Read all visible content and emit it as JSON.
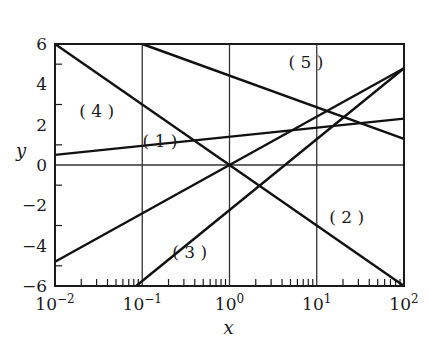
{
  "chart_data": {
    "type": "line",
    "title": "",
    "xlabel": "x",
    "ylabel": "y",
    "xscale": "log",
    "xlim": [
      0.01,
      100
    ],
    "ylim": [
      -6,
      6
    ],
    "x_ticks": [
      {
        "value": 0.01,
        "base": "10",
        "exp": "−2"
      },
      {
        "value": 0.1,
        "base": "10",
        "exp": "−1"
      },
      {
        "value": 1,
        "base": "10",
        "exp": "0"
      },
      {
        "value": 10,
        "base": "10",
        "exp": "1"
      },
      {
        "value": 100,
        "base": "10",
        "exp": "2"
      }
    ],
    "y_ticks": [
      6,
      4,
      2,
      0,
      -2,
      -4,
      -6
    ],
    "y_tick_labels": [
      "6",
      "4",
      "2",
      "0",
      "−2",
      "−4",
      "−6"
    ],
    "grid": {
      "x_lines": [
        0.1,
        1,
        10
      ],
      "y_lines": [
        0
      ]
    },
    "legend": "none (inline labels)",
    "series": [
      {
        "name": "(1)",
        "x": [
          0.01,
          100
        ],
        "y": [
          -4.8,
          4.8
        ],
        "label_pos": [
          0.16,
          0.9
        ]
      },
      {
        "name": "(2)",
        "x": [
          0.01,
          100
        ],
        "y": [
          6,
          -6
        ],
        "label_pos": [
          22,
          -2.9
        ]
      },
      {
        "name": "(3)",
        "x": [
          0.085,
          100
        ],
        "y": [
          -6,
          4.8
        ],
        "label_pos": [
          0.35,
          -4.6
        ]
      },
      {
        "name": "(4)",
        "x": [
          0.01,
          100
        ],
        "y": [
          0.5,
          2.3
        ],
        "label_pos": [
          0.03,
          2.4
        ]
      },
      {
        "name": "(5)",
        "x": [
          0.1,
          100
        ],
        "y": [
          6,
          1.3
        ],
        "label_pos": [
          7.5,
          4.8
        ]
      }
    ]
  },
  "labels": {
    "xlabel": "x",
    "ylabel": "y",
    "curves": [
      "(1)",
      "(2)",
      "(3)",
      "(4)",
      "(5)"
    ]
  }
}
